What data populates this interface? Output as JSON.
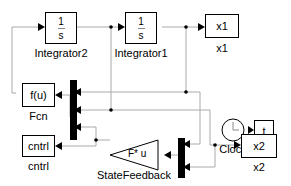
{
  "blocks": {
    "integrator2": {
      "num": "1",
      "den": "s",
      "label": "Integrator2"
    },
    "integrator1": {
      "num": "1",
      "den": "s",
      "label": "Integrator1"
    },
    "x1_out": {
      "text": "x1",
      "label": "x1"
    },
    "clock": {
      "label": "Clock"
    },
    "time_out": {
      "text": "t",
      "label": "time"
    },
    "fcn": {
      "text": "f(u)",
      "label": "Fcn"
    },
    "cntrl_out": {
      "text": "cntrl",
      "label": "cntrl"
    },
    "state_feedback": {
      "text": "F* u",
      "label": "StateFeedback"
    },
    "x2_out": {
      "text": "x2",
      "label": "x2"
    }
  },
  "colors": {
    "line": "#aaaaaa",
    "block": "#000000",
    "mux": "#000000"
  }
}
